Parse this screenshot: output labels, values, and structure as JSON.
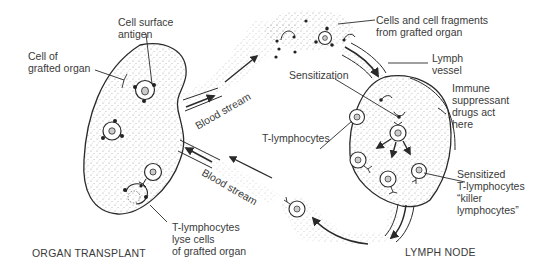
{
  "diagram": {
    "regions": {
      "organ": {
        "caption": "ORGAN TRANSPLANT"
      },
      "node": {
        "caption": "LYMPH NODE"
      }
    },
    "labels": {
      "cell_surface_antigen": [
        "Cell surface",
        "antigen"
      ],
      "cell_of_grafted_organ": [
        "Cell of",
        "grafted organ"
      ],
      "cells_and_fragments": [
        "Cells and cell fragments",
        "from grafted organ"
      ],
      "lymph_vessel": [
        "Lymph",
        "vessel"
      ],
      "sensitization": "Sensitization",
      "immune_suppressant": [
        "Immune",
        "suppressant",
        "drugs act",
        "here"
      ],
      "t_lymphocytes": "T-lymphocytes",
      "sensitized_t_lymphocytes": [
        "Sensitized",
        "T-lymphocytes",
        "“killer",
        "lymphocytes”"
      ],
      "t_lymphocytes_lyse": [
        "T-lymphocytes",
        "lyse cells",
        "of grafted organ"
      ],
      "blood_stream_upper": "Blood stream",
      "blood_stream_lower": "Blood stream"
    },
    "colors": {
      "stroke": "#2a2a2a",
      "stipple": "#9a9a9a",
      "text": "#3a3a3a"
    }
  }
}
